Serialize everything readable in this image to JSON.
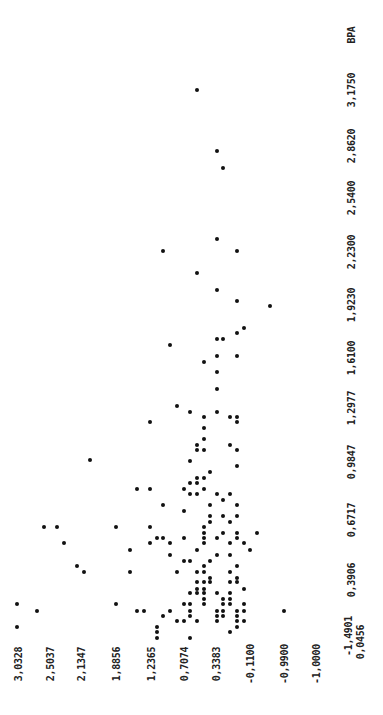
{
  "chart_data": {
    "type": "scatter",
    "title": "",
    "orientation_note_visible": "figure is printed rotated 90 degrees",
    "xlabel": "BPA",
    "ylabel": "",
    "x_ticks": [
      "0,0456",
      "0,3906",
      "0,6717",
      "0,9847",
      "1,2977",
      "1,6100",
      "1,9230",
      "2,2300",
      "2,5400",
      "2,8620",
      "3,1750"
    ],
    "y_ticks": [
      "3,0328",
      "2,5037",
      "2,1347",
      "1,8856",
      "1,2365",
      "0,7074",
      "0,3383",
      "-0,1100",
      "-0,9900",
      "-1,0000",
      "-1,4901"
    ],
    "xlim": [
      0.0456,
      3.175
    ],
    "ylim": [
      -1.4901,
      3.0328
    ],
    "grid": false,
    "legend": null,
    "marker": "filled dot",
    "points_px": [
      [
        197,
        90
      ],
      [
        217,
        151
      ],
      [
        223,
        168
      ],
      [
        217,
        239
      ],
      [
        163,
        251
      ],
      [
        237,
        251
      ],
      [
        197,
        273
      ],
      [
        217,
        290
      ],
      [
        237,
        301
      ],
      [
        270,
        306
      ],
      [
        244,
        328
      ],
      [
        237,
        333
      ],
      [
        217,
        339
      ],
      [
        223,
        339
      ],
      [
        170,
        345
      ],
      [
        217,
        356
      ],
      [
        237,
        356
      ],
      [
        204,
        362
      ],
      [
        217,
        372
      ],
      [
        217,
        389
      ],
      [
        177,
        406
      ],
      [
        190,
        412
      ],
      [
        204,
        417
      ],
      [
        217,
        412
      ],
      [
        230,
        417
      ],
      [
        237,
        417
      ],
      [
        150,
        422
      ],
      [
        237,
        422
      ],
      [
        204,
        428
      ],
      [
        204,
        439
      ],
      [
        197,
        445
      ],
      [
        230,
        445
      ],
      [
        197,
        450
      ],
      [
        204,
        450
      ],
      [
        237,
        450
      ],
      [
        90,
        460
      ],
      [
        190,
        461
      ],
      [
        237,
        466
      ],
      [
        210,
        472
      ],
      [
        197,
        478
      ],
      [
        204,
        478
      ],
      [
        190,
        483
      ],
      [
        197,
        483
      ],
      [
        137,
        489
      ],
      [
        150,
        489
      ],
      [
        184,
        489
      ],
      [
        204,
        489
      ],
      [
        190,
        494
      ],
      [
        197,
        494
      ],
      [
        217,
        494
      ],
      [
        230,
        494
      ],
      [
        223,
        500
      ],
      [
        163,
        505
      ],
      [
        210,
        505
      ],
      [
        237,
        505
      ],
      [
        184,
        511
      ],
      [
        210,
        516
      ],
      [
        223,
        516
      ],
      [
        237,
        516
      ],
      [
        210,
        522
      ],
      [
        230,
        522
      ],
      [
        44,
        527
      ],
      [
        57,
        527
      ],
      [
        116,
        527
      ],
      [
        150,
        527
      ],
      [
        204,
        527
      ],
      [
        204,
        533
      ],
      [
        223,
        533
      ],
      [
        237,
        533
      ],
      [
        257,
        533
      ],
      [
        157,
        538
      ],
      [
        163,
        538
      ],
      [
        184,
        538
      ],
      [
        204,
        538
      ],
      [
        217,
        538
      ],
      [
        237,
        538
      ],
      [
        64,
        543
      ],
      [
        150,
        543
      ],
      [
        170,
        543
      ],
      [
        204,
        543
      ],
      [
        230,
        543
      ],
      [
        244,
        543
      ],
      [
        130,
        550
      ],
      [
        197,
        550
      ],
      [
        250,
        550
      ],
      [
        170,
        555
      ],
      [
        217,
        555
      ],
      [
        230,
        555
      ],
      [
        184,
        561
      ],
      [
        190,
        561
      ],
      [
        210,
        561
      ],
      [
        77,
        566
      ],
      [
        204,
        566
      ],
      [
        237,
        566
      ],
      [
        84,
        572
      ],
      [
        130,
        572
      ],
      [
        177,
        572
      ],
      [
        197,
        572
      ],
      [
        204,
        572
      ],
      [
        230,
        572
      ],
      [
        210,
        578
      ],
      [
        237,
        578
      ],
      [
        197,
        582
      ],
      [
        204,
        582
      ],
      [
        210,
        582
      ],
      [
        230,
        582
      ],
      [
        237,
        582
      ],
      [
        197,
        589
      ],
      [
        204,
        589
      ],
      [
        244,
        589
      ],
      [
        190,
        593
      ],
      [
        197,
        593
      ],
      [
        204,
        593
      ],
      [
        217,
        593
      ],
      [
        230,
        593
      ],
      [
        204,
        599
      ],
      [
        223,
        599
      ],
      [
        230,
        599
      ],
      [
        17,
        604
      ],
      [
        116,
        604
      ],
      [
        184,
        604
      ],
      [
        190,
        604
      ],
      [
        204,
        604
      ],
      [
        223,
        604
      ],
      [
        230,
        604
      ],
      [
        244,
        604
      ],
      [
        37,
        611
      ],
      [
        137,
        611
      ],
      [
        144,
        611
      ],
      [
        170,
        611
      ],
      [
        190,
        611
      ],
      [
        217,
        611
      ],
      [
        223,
        611
      ],
      [
        237,
        611
      ],
      [
        244,
        611
      ],
      [
        284,
        611
      ],
      [
        163,
        616
      ],
      [
        190,
        616
      ],
      [
        217,
        616
      ],
      [
        223,
        616
      ],
      [
        237,
        616
      ],
      [
        177,
        621
      ],
      [
        184,
        621
      ],
      [
        197,
        621
      ],
      [
        217,
        621
      ],
      [
        237,
        621
      ],
      [
        244,
        621
      ],
      [
        17,
        627
      ],
      [
        157,
        627
      ],
      [
        237,
        627
      ],
      [
        157,
        632
      ],
      [
        230,
        632
      ],
      [
        157,
        638
      ],
      [
        190,
        638
      ]
    ]
  },
  "axis_labels": {
    "x_title": "BPA",
    "x_ticks": [
      {
        "text": "3,1750",
        "x": 351,
        "y": 90
      },
      {
        "text": "2,8620",
        "x": 351,
        "y": 146
      },
      {
        "text": "2,5400",
        "x": 351,
        "y": 198
      },
      {
        "text": "2,2300",
        "x": 351,
        "y": 252
      },
      {
        "text": "1,9230",
        "x": 351,
        "y": 305
      },
      {
        "text": "1,6100",
        "x": 351,
        "y": 358
      },
      {
        "text": "1,2977",
        "x": 351,
        "y": 408
      },
      {
        "text": "0,9847",
        "x": 351,
        "y": 462
      },
      {
        "text": "0,6717",
        "x": 351,
        "y": 520
      },
      {
        "text": "0,3906",
        "x": 351,
        "y": 580
      },
      {
        "text": "0,0456",
        "x": 360,
        "y": 642
      }
    ],
    "y_ticks": [
      {
        "text": "3,0328",
        "x": 18,
        "y": 664
      },
      {
        "text": "2,5037",
        "x": 50,
        "y": 664
      },
      {
        "text": "2,1347",
        "x": 81,
        "y": 664
      },
      {
        "text": "1,8856",
        "x": 116,
        "y": 664
      },
      {
        "text": "1,2365",
        "x": 151,
        "y": 664
      },
      {
        "text": "0,7074",
        "x": 184,
        "y": 664
      },
      {
        "text": "0,3383",
        "x": 216,
        "y": 664
      },
      {
        "text": "-0,1100",
        "x": 250,
        "y": 664
      },
      {
        "text": "-0,9900",
        "x": 284,
        "y": 664
      },
      {
        "text": "-1,0000",
        "x": 316,
        "y": 664
      },
      {
        "text": "-1,4901",
        "x": 348,
        "y": 636
      }
    ],
    "x_title_pos": {
      "x": 351,
      "y": 35
    }
  }
}
